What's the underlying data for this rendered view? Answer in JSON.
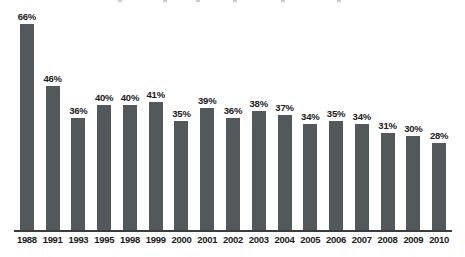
{
  "chart_data": {
    "type": "bar",
    "title": "",
    "subtitle": "",
    "xlabel": "",
    "ylabel": "",
    "ylim": [
      0,
      70
    ],
    "grid": false,
    "legend": false,
    "value_suffix": "%",
    "categories": [
      "1988",
      "1991",
      "1993",
      "1995",
      "1998",
      "1999",
      "2000",
      "2001",
      "2002",
      "2003",
      "2004",
      "2005",
      "2006",
      "2007",
      "2008",
      "2009",
      "2010"
    ],
    "values": [
      66,
      46,
      36,
      40,
      40,
      41,
      35,
      39,
      36,
      38,
      37,
      34,
      35,
      34,
      31,
      30,
      28
    ],
    "data_labels": [
      "66%",
      "46%",
      "36%",
      "40%",
      "40%",
      "41%",
      "35%",
      "39%",
      "36%",
      "38%",
      "37%",
      "34%",
      "35%",
      "34%",
      "31%",
      "30%",
      "28%"
    ],
    "colors": {
      "bar": "#53585a",
      "axis": "#3a3d3f",
      "label": "#1a1a1a",
      "background": "#ffffff"
    }
  }
}
